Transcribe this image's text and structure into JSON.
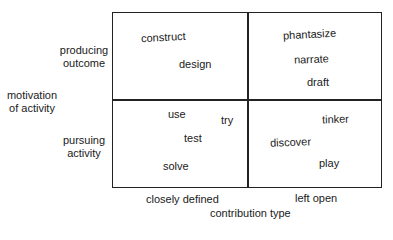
{
  "y_axis": {
    "title_line1": "motivation",
    "title_line2": "of activity",
    "rows": [
      {
        "line1": "producing",
        "line2": "outcome"
      },
      {
        "line1": "pursuing",
        "line2": "activity"
      }
    ]
  },
  "x_axis": {
    "title": "contribution  type",
    "columns": [
      "closely defined",
      "left open"
    ]
  },
  "quadrants": {
    "top_left": [
      "construct",
      "design"
    ],
    "top_right": [
      "phantasize",
      "narrate",
      "draft"
    ],
    "bottom_left": [
      "use",
      "try",
      "test",
      "solve"
    ],
    "bottom_right": [
      "tinker",
      "discover",
      "play"
    ]
  }
}
